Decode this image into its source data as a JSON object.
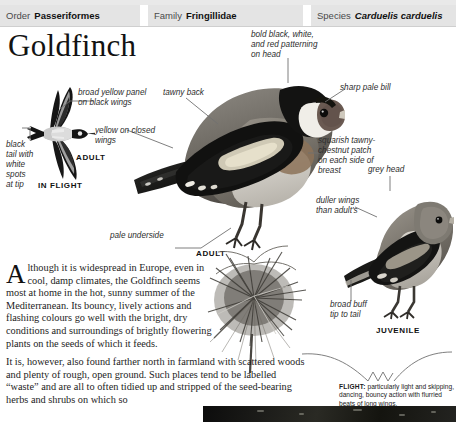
{
  "taxonomy": {
    "order": {
      "label": "Order",
      "value": "Passeriformes"
    },
    "family": {
      "label": "Family",
      "value": "Fringillidae"
    },
    "species": {
      "label": "Species",
      "value": "Carduelis carduelis"
    }
  },
  "page": {
    "title": "Goldfinch"
  },
  "annotations": {
    "broad_yellow_panel": "broad yellow panel\non black wings",
    "black_tail": "black\ntail with\nwhite\nspots\nat tip",
    "tawny_back": "tawny back",
    "bold_head": "bold black, white,\nand red patterning\non head",
    "sharp_bill": "sharp pale bill",
    "yellow_closed_wings": "yellow on closed\nwings",
    "squarish_patch": "squarish tawny-\nchestnut patch\non each side of\nbreast",
    "pale_underside": "pale underside",
    "grey_head": "grey head",
    "duller_wings": "duller wings\nthan adult's",
    "broad_buff_tip": "broad buff\ntip to tail"
  },
  "captions": {
    "adult_flight": "ADULT",
    "in_flight": "IN FLIGHT",
    "adult_perched": "ADULT",
    "juvenile": "JUVENILE",
    "flight_label": "FLIGHT:",
    "flight_text": " particularly light and skipping, dancing, bouncy action with flurried beats of long wings."
  },
  "body": {
    "dropcap": "A",
    "para_narrow": "lthough it is widespread in Europe, even in cool, damp climates, the Goldfinch seems most at home in the hot, sunny summer of the Mediterranean. Its bouncy, lively actions and flashing colours go well with the bright, dry conditions and surroundings of brightly flowering plants on the seeds of which it feeds.",
    "para_wide": "It is, however, also found farther north in farmland with scattered woods and plenty of rough, open ground. Such places tend to be labelled “waste” and are all to often tidied up and stripped of the seed-bearing herbs and shrubs on which so"
  },
  "colors": {
    "header_bg": "#e4e4e4",
    "page_bg": "#ffffff",
    "text": "#1a1a1a",
    "leader": "#707070"
  }
}
